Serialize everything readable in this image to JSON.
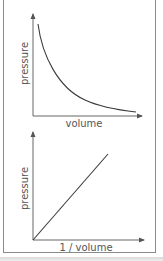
{
  "figure": {
    "top_chart": {
      "ylabel": "pressure",
      "xlabel": "volume",
      "curve": "inverse (hyperbolic decay)"
    },
    "bottom_chart": {
      "ylabel": "pressure",
      "xlabel": "1 / volume",
      "curve": "linear through origin"
    },
    "colors": {
      "axis": "#555555",
      "curve": "#3a3a3a",
      "frame": "#8a8a8a",
      "label": "#555555"
    }
  }
}
